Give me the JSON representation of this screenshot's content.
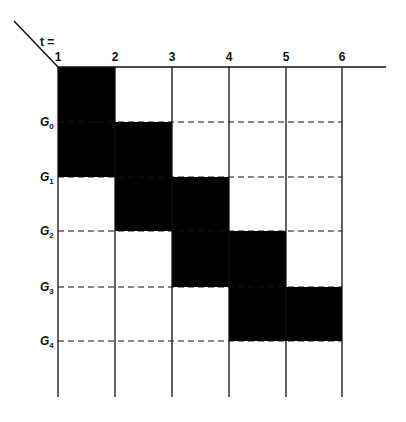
{
  "diagram": {
    "t_label": "t =",
    "columns": [
      {
        "label": "1",
        "x": 58
      },
      {
        "label": "2",
        "x": 115
      },
      {
        "label": "3",
        "x": 172
      },
      {
        "label": "4",
        "x": 229
      },
      {
        "label": "5",
        "x": 286
      },
      {
        "label": "6",
        "x": 342
      }
    ],
    "rows": [
      {
        "label": "G",
        "sub": "0",
        "y": 122
      },
      {
        "label": "G",
        "sub": "1",
        "y": 177
      },
      {
        "label": "G",
        "sub": "2",
        "y": 231
      },
      {
        "label": "G",
        "sub": "3",
        "y": 287
      },
      {
        "label": "G",
        "sub": "4",
        "y": 341
      }
    ],
    "blocks": [
      {
        "col_from": 1,
        "col_to": 2,
        "y_from": 67,
        "y_to": 177
      },
      {
        "col_from": 2,
        "col_to": 3,
        "y_from": 122,
        "y_to": 231
      },
      {
        "col_from": 3,
        "col_to": 4,
        "y_from": 177,
        "y_to": 287
      },
      {
        "col_from": 4,
        "col_to": 5,
        "y_from": 231,
        "y_to": 341
      },
      {
        "col_from": 5,
        "col_to": 6,
        "y_from": 287,
        "y_to": 341
      }
    ],
    "colors": {
      "ink": "#111111",
      "fill": "#000000",
      "background": "#ffffff"
    }
  }
}
